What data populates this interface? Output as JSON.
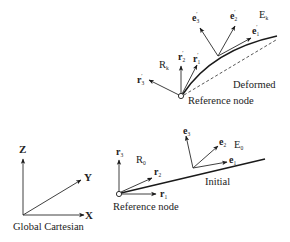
{
  "global_frame": {
    "title": "Global Cartesian",
    "axes": {
      "x": "X",
      "y": "Y",
      "z": "Z"
    }
  },
  "initial": {
    "label": "Initial",
    "reference_node_label": "Reference node",
    "node_frame_label": "R",
    "node_frame_sub": "0",
    "element_frame_label": "E",
    "element_frame_sub": "0",
    "node_vectors": [
      {
        "name": "r",
        "sub": "1"
      },
      {
        "name": "r",
        "sub": "2"
      },
      {
        "name": "r",
        "sub": "3"
      }
    ],
    "element_vectors": [
      {
        "name": "e",
        "sub": "1"
      },
      {
        "name": "e",
        "sub": "2"
      },
      {
        "name": "e",
        "sub": "3"
      }
    ]
  },
  "deformed": {
    "label": "Deformed",
    "reference_node_label": "Reference node",
    "node_frame_label": "R",
    "node_frame_sub": "k",
    "element_frame_label": "E",
    "element_frame_sub": "k",
    "prime": "′",
    "node_vectors": [
      {
        "name": "r",
        "sub": "1"
      },
      {
        "name": "r",
        "sub": "2"
      },
      {
        "name": "r",
        "sub": "3"
      }
    ],
    "element_vectors": [
      {
        "name": "e",
        "sub": "1"
      },
      {
        "name": "e",
        "sub": "2"
      },
      {
        "name": "e",
        "sub": "3"
      }
    ]
  }
}
